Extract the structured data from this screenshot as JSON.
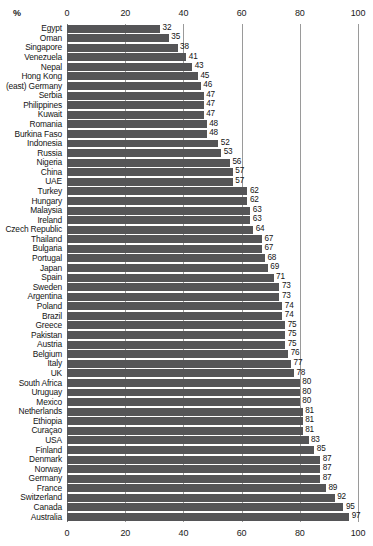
{
  "chart_data": {
    "type": "bar",
    "orientation": "horizontal",
    "title": "",
    "subtitle": "",
    "xlabel": "%",
    "ylabel": "",
    "xlim": [
      0,
      100
    ],
    "ylim": null,
    "grid": true,
    "grid_axis": "x",
    "legend": null,
    "legend_position": "none",
    "bar_color": "#555557",
    "axis_color": "#9a9a9a",
    "text_color": "#141414",
    "xticks": [
      0,
      20,
      40,
      60,
      80,
      100
    ],
    "xtick_labels": [
      "0",
      "20",
      "40",
      "60",
      "80",
      "100"
    ],
    "xtick_labels_top": [
      "0",
      "20",
      "40",
      "60",
      "80",
      "100"
    ],
    "xtick_labels_bottom": [
      "0",
      "20",
      "40",
      "60",
      "80",
      "100"
    ],
    "show_value_labels": true,
    "categories": [
      "Egypt",
      "Oman",
      "Singapore",
      "Venezuela",
      "Nepal",
      "Hong Kong",
      "(east) Germany",
      "Serbia",
      "Philippines",
      "Kuwait",
      "Romania",
      "Burkina Faso",
      "Indonesia",
      "Russia",
      "Nigeria",
      "China",
      "UAE",
      "Turkey",
      "Hungary",
      "Malaysia",
      "Ireland",
      "Czech Republic",
      "Thailand",
      "Bulgaria",
      "Portugal",
      "Japan",
      "Spain",
      "Sweden",
      "Argentina",
      "Poland",
      "Brazil",
      "Greece",
      "Pakistan",
      "Austria",
      "Belgium",
      "Italy",
      "UK",
      "South Africa",
      "Uruguay",
      "Mexico",
      "Netherlands",
      "Ethiopia",
      "Curaçao",
      "USA",
      "Finland",
      "Denmark",
      "Norway",
      "Germany",
      "France",
      "Switzerland",
      "Canada",
      "Australia"
    ],
    "values": [
      32,
      35,
      38,
      41,
      43,
      45,
      46,
      47,
      47,
      47,
      48,
      48,
      52,
      53,
      56,
      57,
      57,
      62,
      62,
      63,
      63,
      64,
      67,
      67,
      68,
      69,
      71,
      73,
      73,
      74,
      74,
      75,
      75,
      75,
      76,
      77,
      78,
      80,
      80,
      80,
      81,
      81,
      81,
      83,
      85,
      87,
      87,
      87,
      89,
      92,
      95,
      97
    ],
    "value_labels": [
      "32",
      "35",
      "38",
      "41",
      "43",
      "45",
      "46",
      "47",
      "47",
      "47",
      "48",
      "48",
      "52",
      "53",
      "56",
      "57",
      "57",
      "62",
      "62",
      "63",
      "63",
      "64",
      "67",
      "67",
      "68",
      "69",
      "71",
      "73",
      "73",
      "74",
      "74",
      "75",
      "75",
      "75",
      "76",
      "77",
      "78",
      "80",
      "80",
      "80",
      "81",
      "81",
      "81",
      "83",
      "85",
      "87",
      "87",
      "87",
      "89",
      "92",
      "95",
      "97"
    ]
  }
}
